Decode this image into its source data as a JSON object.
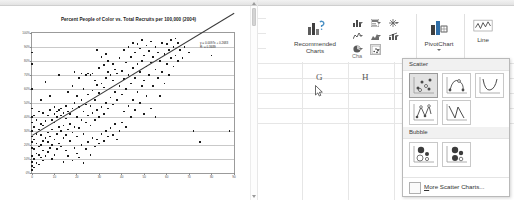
{
  "left_panel": {
    "name": "scatter-chart-document",
    "chart_title": "Percent People of Color vs. Total Recruits per 100,000 (2004)",
    "trend_equation": "y = 0.0097x + 0.2683",
    "trend_r2": "R² = 0.3689",
    "scrollbar": {
      "up_arrow": "scroll-up",
      "down_arrow": "scroll-down"
    }
  },
  "chart_data": {
    "type": "scatter",
    "title": "Percent People of Color vs. Total Recruits per 100,000 (2004)",
    "xlabel": "",
    "ylabel": "",
    "xlim": [
      0,
      90
    ],
    "ylim": [
      0,
      1
    ],
    "grid": true,
    "legend": false,
    "xticks": [
      0,
      10,
      20,
      30,
      40,
      50,
      60,
      70,
      80,
      90
    ],
    "yticks": [
      "0%",
      "10%",
      "20%",
      "30%",
      "40%",
      "50%",
      "60%",
      "70%",
      "80%",
      "90%",
      "100%"
    ],
    "ytick_values": [
      0,
      0.1,
      0.2,
      0.3,
      0.4,
      0.5,
      0.6,
      0.7,
      0.8,
      0.9,
      1.0
    ],
    "marker": "black diamond",
    "trendline": {
      "slope": 0.0097,
      "intercept": 0.2683,
      "r2": 0.3689,
      "x_from": 0,
      "x_to": 90
    },
    "annotations": [
      "y = 0.0097x + 0.2683",
      "R² = 0.3689"
    ],
    "points": [
      [
        0,
        0.02
      ],
      [
        0,
        0.05
      ],
      [
        0,
        0.08
      ],
      [
        0,
        0.12
      ],
      [
        0,
        0.18
      ],
      [
        0,
        0.22
      ],
      [
        0,
        0.26
      ],
      [
        0,
        0.3
      ],
      [
        0,
        0.36
      ],
      [
        0,
        0.4
      ],
      [
        0,
        0.46
      ],
      [
        0,
        0.6
      ],
      [
        0,
        0.78
      ],
      [
        0,
        0.86
      ],
      [
        1,
        0.04
      ],
      [
        1,
        0.1
      ],
      [
        1,
        0.17
      ],
      [
        1,
        0.24
      ],
      [
        1,
        0.33
      ],
      [
        1,
        0.41
      ],
      [
        2,
        0.07
      ],
      [
        2,
        0.14
      ],
      [
        2,
        0.21
      ],
      [
        2,
        0.28
      ],
      [
        2,
        0.38
      ],
      [
        3,
        0.06
      ],
      [
        3,
        0.13
      ],
      [
        3,
        0.19
      ],
      [
        3,
        0.31
      ],
      [
        3,
        0.44
      ],
      [
        4,
        0.11
      ],
      [
        4,
        0.2
      ],
      [
        4,
        0.27
      ],
      [
        4,
        0.35
      ],
      [
        4,
        0.52
      ],
      [
        5,
        0.09
      ],
      [
        5,
        0.16
      ],
      [
        5,
        0.23
      ],
      [
        5,
        0.34
      ],
      [
        5,
        0.43
      ],
      [
        6,
        0.12
      ],
      [
        6,
        0.25
      ],
      [
        6,
        0.37
      ],
      [
        6,
        0.65
      ],
      [
        7,
        0.15
      ],
      [
        7,
        0.22
      ],
      [
        7,
        0.29
      ],
      [
        7,
        0.41
      ],
      [
        8,
        0.18
      ],
      [
        8,
        0.26
      ],
      [
        8,
        0.45
      ],
      [
        8,
        0.55
      ],
      [
        9,
        0.1
      ],
      [
        9,
        0.2
      ],
      [
        9,
        0.31
      ],
      [
        9,
        0.38
      ],
      [
        10,
        0.13
      ],
      [
        10,
        0.24
      ],
      [
        10,
        0.36
      ],
      [
        10,
        0.42
      ],
      [
        10,
        0.47
      ],
      [
        11,
        0.17
      ],
      [
        11,
        0.28
      ],
      [
        11,
        0.4
      ],
      [
        11,
        0.44
      ],
      [
        12,
        0.21
      ],
      [
        12,
        0.33
      ],
      [
        12,
        0.45
      ],
      [
        12,
        0.7
      ],
      [
        13,
        0.19
      ],
      [
        13,
        0.3
      ],
      [
        13,
        0.41
      ],
      [
        13,
        0.46
      ],
      [
        14,
        0.08
      ],
      [
        14,
        0.25
      ],
      [
        14,
        0.34
      ],
      [
        14,
        0.43
      ],
      [
        15,
        0.16
      ],
      [
        15,
        0.27
      ],
      [
        15,
        0.39
      ],
      [
        15,
        0.48
      ],
      [
        16,
        0.12
      ],
      [
        16,
        0.31
      ],
      [
        16,
        0.44
      ],
      [
        16,
        0.58
      ],
      [
        17,
        0.23
      ],
      [
        17,
        0.35
      ],
      [
        17,
        0.42
      ],
      [
        18,
        0.09
      ],
      [
        18,
        0.29
      ],
      [
        18,
        0.46
      ],
      [
        18,
        0.62
      ],
      [
        19,
        0.18
      ],
      [
        19,
        0.33
      ],
      [
        19,
        0.5
      ],
      [
        19,
        0.72
      ],
      [
        20,
        0.14
      ],
      [
        20,
        0.26
      ],
      [
        20,
        0.4
      ],
      [
        20,
        0.55
      ],
      [
        21,
        0.11
      ],
      [
        21,
        0.32
      ],
      [
        21,
        0.47
      ],
      [
        21,
        0.68
      ],
      [
        22,
        0.2
      ],
      [
        22,
        0.38
      ],
      [
        22,
        0.52
      ],
      [
        22,
        0.71
      ],
      [
        23,
        0.07
      ],
      [
        23,
        0.28
      ],
      [
        23,
        0.44
      ],
      [
        23,
        0.6
      ],
      [
        24,
        0.17
      ],
      [
        24,
        0.36
      ],
      [
        24,
        0.49
      ],
      [
        24,
        0.7
      ],
      [
        25,
        0.22
      ],
      [
        25,
        0.41
      ],
      [
        25,
        0.56
      ],
      [
        25,
        0.71
      ],
      [
        26,
        0.13
      ],
      [
        26,
        0.34
      ],
      [
        26,
        0.48
      ],
      [
        26,
        0.7
      ],
      [
        27,
        0.25
      ],
      [
        27,
        0.43
      ],
      [
        27,
        0.59
      ],
      [
        27,
        0.71
      ],
      [
        28,
        0.19
      ],
      [
        28,
        0.38
      ],
      [
        28,
        0.52
      ],
      [
        28,
        0.66
      ],
      [
        29,
        0.24
      ],
      [
        29,
        0.45
      ],
      [
        29,
        0.63
      ],
      [
        29,
        0.88
      ],
      [
        30,
        0.21
      ],
      [
        30,
        0.4
      ],
      [
        30,
        0.57
      ],
      [
        30,
        0.75
      ],
      [
        31,
        0.28
      ],
      [
        31,
        0.47
      ],
      [
        31,
        0.64
      ],
      [
        31,
        0.83
      ],
      [
        32,
        0.23
      ],
      [
        32,
        0.42
      ],
      [
        32,
        0.61
      ],
      [
        32,
        0.77
      ],
      [
        33,
        0.3
      ],
      [
        33,
        0.5
      ],
      [
        33,
        0.68
      ],
      [
        33,
        0.85
      ],
      [
        34,
        0.26
      ],
      [
        34,
        0.46
      ],
      [
        34,
        0.72
      ],
      [
        34,
        0.8
      ],
      [
        35,
        0.32
      ],
      [
        35,
        0.54
      ],
      [
        35,
        0.7
      ],
      [
        36,
        0.27
      ],
      [
        36,
        0.49
      ],
      [
        36,
        0.66
      ],
      [
        36,
        0.78
      ],
      [
        37,
        0.35
      ],
      [
        37,
        0.58
      ],
      [
        37,
        0.74
      ],
      [
        38,
        0.24
      ],
      [
        38,
        0.52
      ],
      [
        38,
        0.71
      ],
      [
        39,
        0.3
      ],
      [
        39,
        0.62
      ],
      [
        39,
        0.82
      ],
      [
        40,
        0.36
      ],
      [
        40,
        0.56
      ],
      [
        40,
        0.73
      ],
      [
        41,
        0.44
      ],
      [
        41,
        0.67
      ],
      [
        41,
        0.88
      ],
      [
        42,
        0.33
      ],
      [
        42,
        0.6
      ],
      [
        42,
        0.79
      ],
      [
        43,
        0.48
      ],
      [
        43,
        0.7
      ],
      [
        43,
        0.9
      ],
      [
        44,
        0.4
      ],
      [
        44,
        0.64
      ],
      [
        44,
        0.83
      ],
      [
        45,
        0.52
      ],
      [
        45,
        0.75
      ],
      [
        45,
        0.93
      ],
      [
        46,
        0.45
      ],
      [
        46,
        0.68
      ],
      [
        46,
        0.86
      ],
      [
        47,
        0.58
      ],
      [
        47,
        0.78
      ],
      [
        47,
        0.92
      ],
      [
        48,
        0.5
      ],
      [
        48,
        0.72
      ],
      [
        48,
        0.89
      ],
      [
        49,
        0.62
      ],
      [
        49,
        0.8
      ],
      [
        49,
        0.95
      ],
      [
        50,
        0.42
      ],
      [
        50,
        0.66
      ],
      [
        50,
        0.84
      ],
      [
        51,
        0.55
      ],
      [
        51,
        0.76
      ],
      [
        51,
        0.91
      ],
      [
        52,
        0.7
      ],
      [
        52,
        0.87
      ],
      [
        53,
        0.46
      ],
      [
        53,
        0.79
      ],
      [
        53,
        0.94
      ],
      [
        54,
        0.62
      ],
      [
        54,
        0.83
      ],
      [
        55,
        0.4
      ],
      [
        55,
        0.74
      ],
      [
        55,
        0.9
      ],
      [
        56,
        0.68
      ],
      [
        56,
        0.86
      ],
      [
        57,
        0.55
      ],
      [
        57,
        0.8
      ],
      [
        58,
        0.72
      ],
      [
        58,
        0.93
      ],
      [
        59,
        0.64
      ],
      [
        59,
        0.85
      ],
      [
        60,
        0.78
      ],
      [
        60,
        0.92
      ],
      [
        61,
        0.7
      ],
      [
        61,
        0.88
      ],
      [
        62,
        0.82
      ],
      [
        62,
        0.95
      ],
      [
        63,
        0.76
      ],
      [
        63,
        0.9
      ],
      [
        64,
        0.84
      ],
      [
        64,
        0.96
      ],
      [
        65,
        0.8
      ],
      [
        65,
        0.93
      ],
      [
        66,
        0.88
      ],
      [
        67,
        0.82
      ],
      [
        68,
        0.9
      ],
      [
        70,
        0.86
      ],
      [
        72,
        0.3
      ],
      [
        75,
        0.22
      ],
      [
        80,
        0.84
      ],
      [
        88,
        0.3
      ]
    ]
  },
  "right_panel": {
    "name": "excel-insert-ribbon",
    "worksheet": {
      "column_headers": [
        "G",
        "H"
      ]
    },
    "ribbon": {
      "group_label": "Cha",
      "recommended_charts": {
        "line1": "Recommended",
        "line2": "Charts"
      },
      "chart_type_buttons": [
        {
          "name": "column-chart-button",
          "label": ""
        },
        {
          "name": "hierarchy-chart-button",
          "label": ""
        },
        {
          "name": "waterfall-chart-button",
          "label": ""
        },
        {
          "name": "line-chart-button",
          "label": ""
        },
        {
          "name": "area-chart-button",
          "label": ""
        },
        {
          "name": "statistic-chart-button",
          "label": ""
        },
        {
          "name": "pie-chart-button",
          "label": ""
        },
        {
          "name": "scatter-chart-button",
          "label": ""
        }
      ],
      "pivotchart": {
        "label": "PivotChart"
      },
      "sparkline_line": {
        "label": "Line"
      }
    },
    "gallery": {
      "sections": [
        {
          "name": "scatter-section",
          "label": "Scatter",
          "items": [
            "scatter-markers-only",
            "scatter-smooth-lines-markers",
            "scatter-smooth-lines",
            "scatter-straight-lines-markers",
            "scatter-straight-lines"
          ],
          "selected_index": 0
        },
        {
          "name": "bubble-section",
          "label": "Bubble",
          "items": [
            "bubble",
            "bubble-3d"
          ],
          "selected_index": -1
        }
      ],
      "more_label_prefix": "M",
      "more_label_rest": "ore Scatter Charts..."
    },
    "cursor": "mouse-pointer"
  }
}
